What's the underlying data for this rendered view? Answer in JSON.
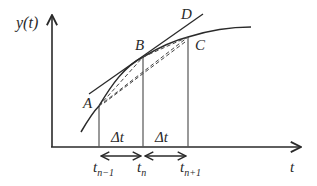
{
  "diagram": {
    "type": "function-curve-secant-tangent",
    "axes": {
      "y_label": "y(t)",
      "x_label": "t"
    },
    "points": [
      {
        "id": "A",
        "label": "A"
      },
      {
        "id": "B",
        "label": "B"
      },
      {
        "id": "C",
        "label": "C"
      },
      {
        "id": "D",
        "label": "D"
      }
    ],
    "intervals": [
      {
        "label": "Δt"
      },
      {
        "label": "Δt"
      }
    ],
    "ticks": [
      {
        "base": "t",
        "sub": "n−1"
      },
      {
        "base": "t",
        "sub": "n"
      },
      {
        "base": "t",
        "sub": "n+1"
      }
    ],
    "colors": {
      "line": "#2a2a2a",
      "background": "#ffffff"
    }
  }
}
